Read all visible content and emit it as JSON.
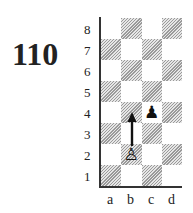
{
  "diagram_number": "110",
  "ranks": [
    "8",
    "7",
    "6",
    "5",
    "4",
    "3",
    "2",
    "1"
  ],
  "files": [
    "a",
    "b",
    "c",
    "d"
  ],
  "pieces": [
    {
      "square": "b2",
      "piece": "white-pawn",
      "glyph": "♙"
    },
    {
      "square": "c4",
      "piece": "black-pawn",
      "glyph": "♟"
    }
  ],
  "arrows": [
    {
      "from": "b2",
      "to": "b4"
    }
  ]
}
